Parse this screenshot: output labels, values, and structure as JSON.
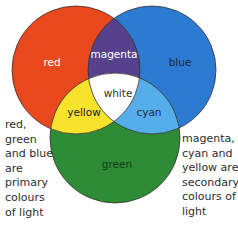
{
  "diagram": {
    "colors": {
      "red": "#e8481c",
      "blue": "#2a7bd1",
      "green": "#2e8b36",
      "magenta": "#56428c",
      "yellow": "#f7e22c",
      "cyan": "#55aee9",
      "white": "#ffffff",
      "outline": "#3a3030"
    },
    "labels": {
      "red": "red",
      "blue": "blue",
      "green": "green",
      "magenta": "magenta",
      "yellow": "yellow",
      "cyan": "cyan",
      "white": "white"
    },
    "label_colors": {
      "red": "#ffffff",
      "blue": "#1a2a44",
      "green": "#1a3a1a",
      "magenta": "#ffffff",
      "yellow": "#222222",
      "cyan": "#1a2a44",
      "white": "#333333"
    },
    "notes": {
      "left": "red,\ngreen\nand blue\nare\nprimary\ncolours\nof light",
      "right": "magenta,\ncyan and\nyellow are\nsecondary\ncolours of\nlight"
    }
  }
}
